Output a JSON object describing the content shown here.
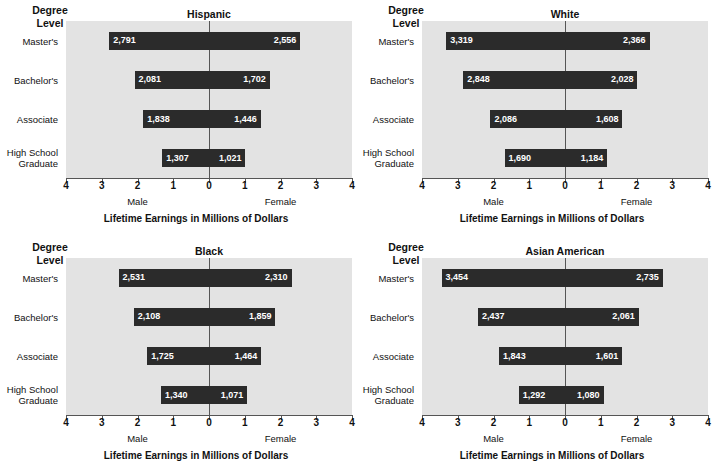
{
  "figure": {
    "degree_level_label_line1": "Degree",
    "degree_level_label_line2": "Level",
    "axis_title": "Lifetime Earnings in Millions of Dollars",
    "male_label": "Male",
    "female_label": "Female",
    "tick_labels": [
      "4",
      "3",
      "2",
      "1",
      "0",
      "1",
      "2",
      "3",
      "4"
    ],
    "categories": [
      "Master's",
      "Bachelor's",
      "Associate",
      "High School Graduate"
    ],
    "category_lines": [
      [
        "Master's"
      ],
      [
        "Bachelor's"
      ],
      [
        "Associate"
      ],
      [
        "High School",
        "Graduate"
      ]
    ],
    "colors": {
      "plot_background": "#e3e3e3",
      "bar": "#2b2b2b",
      "axis": "#555555",
      "text": "#111111",
      "bar_value_text": "#ffffff"
    }
  },
  "chart_data": [
    {
      "type": "bar",
      "title": "Hispanic",
      "xlabel": "Lifetime Earnings in Millions of Dollars",
      "ylabel": "Degree Level",
      "orientation": "horizontal",
      "style": "diverging-bidirectional",
      "xlim": [
        -4,
        4
      ],
      "xticks": [
        -4,
        -3,
        -2,
        -1,
        0,
        1,
        2,
        3,
        4
      ],
      "xticklabels": [
        "4",
        "3",
        "2",
        "1",
        "0",
        "1",
        "2",
        "3",
        "4"
      ],
      "grid": false,
      "legend": "none",
      "left_direction_label": "Male",
      "right_direction_label": "Female",
      "categories": [
        "Master's",
        "Bachelor's",
        "Associate",
        "High School Graduate"
      ],
      "series": [
        {
          "name": "Male",
          "unit": "millions of dollars",
          "values": [
            2.791,
            2.081,
            1.838,
            1.307
          ],
          "labels": [
            "2,791",
            "2,081",
            "1,838",
            "1,307"
          ]
        },
        {
          "name": "Female",
          "unit": "millions of dollars",
          "values": [
            2.556,
            1.702,
            1.446,
            1.021
          ],
          "labels": [
            "2,556",
            "1,702",
            "1,446",
            "1,021"
          ]
        }
      ]
    },
    {
      "type": "bar",
      "title": "White",
      "xlabel": "Lifetime Earnings in Millions of Dollars",
      "ylabel": "Degree Level",
      "orientation": "horizontal",
      "style": "diverging-bidirectional",
      "xlim": [
        -4,
        4
      ],
      "xticks": [
        -4,
        -3,
        -2,
        -1,
        0,
        1,
        2,
        3,
        4
      ],
      "xticklabels": [
        "4",
        "3",
        "2",
        "1",
        "0",
        "1",
        "2",
        "3",
        "4"
      ],
      "grid": false,
      "legend": "none",
      "left_direction_label": "Male",
      "right_direction_label": "Female",
      "categories": [
        "Master's",
        "Bachelor's",
        "Associate",
        "High School Graduate"
      ],
      "series": [
        {
          "name": "Male",
          "unit": "millions of dollars",
          "values": [
            3.319,
            2.848,
            2.086,
            1.69
          ],
          "labels": [
            "3,319",
            "2,848",
            "2,086",
            "1,690"
          ]
        },
        {
          "name": "Female",
          "unit": "millions of dollars",
          "values": [
            2.366,
            2.028,
            1.608,
            1.184
          ],
          "labels": [
            "2,366",
            "2,028",
            "1,608",
            "1,184"
          ]
        }
      ]
    },
    {
      "type": "bar",
      "title": "Black",
      "xlabel": "Lifetime Earnings in Millions of Dollars",
      "ylabel": "Degree Level",
      "orientation": "horizontal",
      "style": "diverging-bidirectional",
      "xlim": [
        -4,
        4
      ],
      "xticks": [
        -4,
        -3,
        -2,
        -1,
        0,
        1,
        2,
        3,
        4
      ],
      "xticklabels": [
        "4",
        "3",
        "2",
        "1",
        "0",
        "1",
        "2",
        "3",
        "4"
      ],
      "grid": false,
      "legend": "none",
      "left_direction_label": "Male",
      "right_direction_label": "Female",
      "categories": [
        "Master's",
        "Bachelor's",
        "Associate",
        "High School Graduate"
      ],
      "series": [
        {
          "name": "Male",
          "unit": "millions of dollars",
          "values": [
            2.531,
            2.108,
            1.725,
            1.34
          ],
          "labels": [
            "2,531",
            "2,108",
            "1,725",
            "1,340"
          ]
        },
        {
          "name": "Female",
          "unit": "millions of dollars",
          "values": [
            2.31,
            1.859,
            1.464,
            1.071
          ],
          "labels": [
            "2,310",
            "1,859",
            "1,464",
            "1,071"
          ]
        }
      ]
    },
    {
      "type": "bar",
      "title": "Asian American",
      "xlabel": "Lifetime Earnings in Millions of Dollars",
      "ylabel": "Degree Level",
      "orientation": "horizontal",
      "style": "diverging-bidirectional",
      "xlim": [
        -4,
        4
      ],
      "xticks": [
        -4,
        -3,
        -2,
        -1,
        0,
        1,
        2,
        3,
        4
      ],
      "xticklabels": [
        "4",
        "3",
        "2",
        "1",
        "0",
        "1",
        "2",
        "3",
        "4"
      ],
      "grid": false,
      "legend": "none",
      "left_direction_label": "Male",
      "right_direction_label": "Female",
      "categories": [
        "Master's",
        "Bachelor's",
        "Associate",
        "High School Graduate"
      ],
      "series": [
        {
          "name": "Male",
          "unit": "millions of dollars",
          "values": [
            3.454,
            2.437,
            1.843,
            1.292
          ],
          "labels": [
            "3,454",
            "2,437",
            "1,843",
            "1,292"
          ]
        },
        {
          "name": "Female",
          "unit": "millions of dollars",
          "values": [
            2.735,
            2.061,
            1.601,
            1.08
          ],
          "labels": [
            "2,735",
            "2,061",
            "1,601",
            "1,080"
          ]
        }
      ]
    }
  ]
}
